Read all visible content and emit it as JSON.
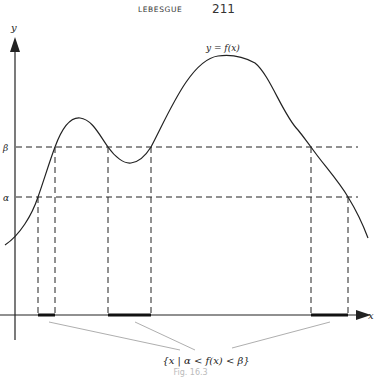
{
  "header": {
    "running_head": "LEBESGUE",
    "page_number": "211"
  },
  "figure": {
    "y_axis_label": "y",
    "x_axis_label": "x",
    "curve_label": "y = f(x)",
    "beta_label": "β",
    "alpha_label": "α",
    "set_label": "{x | α < f(x) < β}",
    "caption": "Fig. 16.3",
    "colors": {
      "ink": "#222222",
      "pointer": "#999999"
    },
    "levels": {
      "beta_y": 147,
      "alpha_y": 197
    },
    "intervals": [
      {
        "from_x": 38,
        "to_x": 55
      },
      {
        "from_x": 108,
        "to_x": 151
      },
      {
        "from_x": 311,
        "to_x": 348
      }
    ]
  }
}
